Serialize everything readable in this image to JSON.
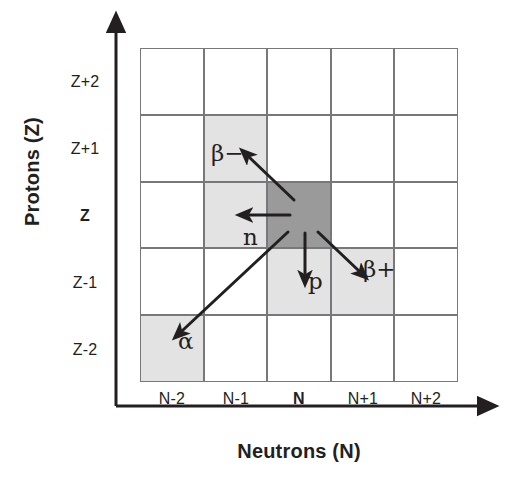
{
  "figure": {
    "axes": {
      "y_title": "Protons (Z)",
      "x_title": "Neutrons (N)",
      "y_ticks": [
        "Z+2",
        "Z+1",
        "Z",
        "Z-1",
        "Z-2"
      ],
      "x_ticks": [
        "N-2",
        "N-1",
        "N",
        "N+1",
        "N+2"
      ],
      "y_bold_tick": "Z",
      "x_bold_tick": "N"
    },
    "decay_labels": {
      "beta_minus": "β−",
      "beta_plus": "β+",
      "neutron": "n",
      "proton": "p",
      "alpha": "α"
    },
    "colors": {
      "parent_cell": "#9a9a9a",
      "daughter_cell": "#e3e3e3",
      "empty_cell": "#ffffff",
      "grid_line": "#77787b",
      "ink": "#231f20"
    }
  },
  "chart_data": {
    "type": "heatmap",
    "title": "",
    "xlabel": "Neutrons (N)",
    "ylabel": "Protons (Z)",
    "grid": true,
    "legend_position": "none",
    "x": [
      "N-2",
      "N-1",
      "N",
      "N+1",
      "N+2"
    ],
    "y": [
      "Z+2",
      "Z+1",
      "Z",
      "Z-1",
      "Z-2"
    ],
    "cells": [
      {
        "x": "N-2",
        "y": "Z+2",
        "state": "empty",
        "fill": "#ffffff"
      },
      {
        "x": "N-1",
        "y": "Z+2",
        "state": "empty",
        "fill": "#ffffff"
      },
      {
        "x": "N",
        "y": "Z+2",
        "state": "empty",
        "fill": "#ffffff"
      },
      {
        "x": "N+1",
        "y": "Z+2",
        "state": "empty",
        "fill": "#ffffff"
      },
      {
        "x": "N+2",
        "y": "Z+2",
        "state": "empty",
        "fill": "#ffffff"
      },
      {
        "x": "N-2",
        "y": "Z+1",
        "state": "empty",
        "fill": "#ffffff"
      },
      {
        "x": "N-1",
        "y": "Z+1",
        "state": "daughter",
        "fill": "#e3e3e3",
        "decay": "β−"
      },
      {
        "x": "N",
        "y": "Z+1",
        "state": "empty",
        "fill": "#ffffff"
      },
      {
        "x": "N+1",
        "y": "Z+1",
        "state": "empty",
        "fill": "#ffffff"
      },
      {
        "x": "N+2",
        "y": "Z+1",
        "state": "empty",
        "fill": "#ffffff"
      },
      {
        "x": "N-2",
        "y": "Z",
        "state": "empty",
        "fill": "#ffffff"
      },
      {
        "x": "N-1",
        "y": "Z",
        "state": "daughter",
        "fill": "#e3e3e3",
        "decay": "n"
      },
      {
        "x": "N",
        "y": "Z",
        "state": "parent",
        "fill": "#9a9a9a"
      },
      {
        "x": "N+1",
        "y": "Z",
        "state": "empty",
        "fill": "#ffffff"
      },
      {
        "x": "N+2",
        "y": "Z",
        "state": "empty",
        "fill": "#ffffff"
      },
      {
        "x": "N-2",
        "y": "Z-1",
        "state": "empty",
        "fill": "#ffffff"
      },
      {
        "x": "N-1",
        "y": "Z-1",
        "state": "empty",
        "fill": "#ffffff"
      },
      {
        "x": "N",
        "y": "Z-1",
        "state": "daughter",
        "fill": "#e3e3e3",
        "decay": "p"
      },
      {
        "x": "N+1",
        "y": "Z-1",
        "state": "daughter",
        "fill": "#e3e3e3",
        "decay": "β+"
      },
      {
        "x": "N+2",
        "y": "Z-1",
        "state": "empty",
        "fill": "#ffffff"
      },
      {
        "x": "N-2",
        "y": "Z-2",
        "state": "daughter",
        "fill": "#e3e3e3",
        "decay": "α"
      },
      {
        "x": "N-1",
        "y": "Z-2",
        "state": "empty",
        "fill": "#ffffff"
      },
      {
        "x": "N",
        "y": "Z-2",
        "state": "empty",
        "fill": "#ffffff"
      },
      {
        "x": "N+1",
        "y": "Z-2",
        "state": "empty",
        "fill": "#ffffff"
      },
      {
        "x": "N+2",
        "y": "Z-2",
        "state": "empty",
        "fill": "#ffffff"
      }
    ],
    "transitions": [
      {
        "label": "β−",
        "from": [
          "N",
          "Z"
        ],
        "to": [
          "N-1",
          "Z+1"
        ]
      },
      {
        "label": "n",
        "from": [
          "N",
          "Z"
        ],
        "to": [
          "N-1",
          "Z"
        ]
      },
      {
        "label": "p",
        "from": [
          "N",
          "Z"
        ],
        "to": [
          "N",
          "Z-1"
        ]
      },
      {
        "label": "β+",
        "from": [
          "N",
          "Z"
        ],
        "to": [
          "N+1",
          "Z-1"
        ]
      },
      {
        "label": "α",
        "from": [
          "N",
          "Z"
        ],
        "to": [
          "N-2",
          "Z-2"
        ]
      }
    ]
  }
}
